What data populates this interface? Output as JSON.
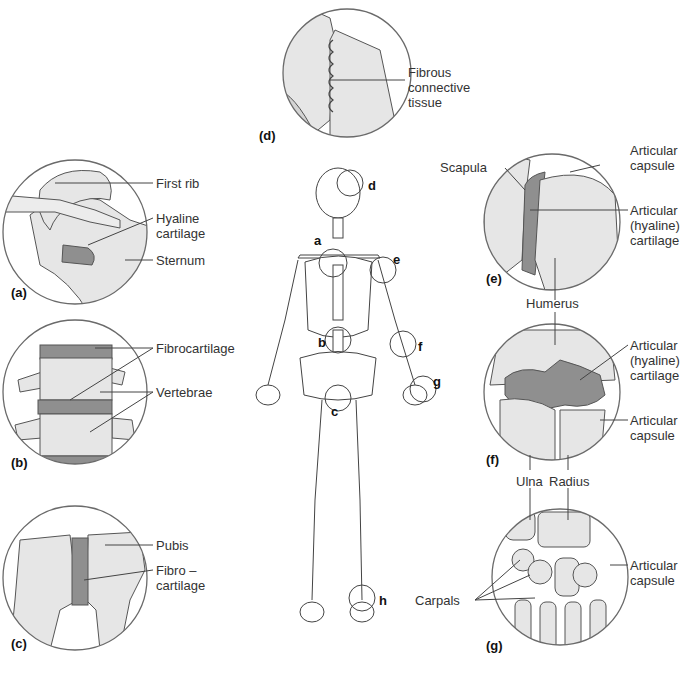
{
  "figure": {
    "type": "anatomy-diagram",
    "colors": {
      "bone": "#e6e6e6",
      "cartilage": "#8f8f8f",
      "outline": "#555555",
      "circle": "#6a6a6a",
      "background": "#ffffff"
    }
  },
  "skeleton_markers": [
    "a",
    "b",
    "c",
    "d",
    "e",
    "f",
    "g",
    "h"
  ],
  "panels": {
    "a": {
      "tag": "(a)",
      "labels": [
        "First rib",
        "Hyaline",
        "cartilage",
        "Sternum"
      ]
    },
    "b": {
      "tag": "(b)",
      "labels": [
        "Fibrocartilage",
        "Vertebrae"
      ]
    },
    "c": {
      "tag": "(c)",
      "labels": [
        "Pubis",
        "Fibro –",
        "cartilage"
      ]
    },
    "d": {
      "tag": "(d)",
      "labels": [
        "Fibrous",
        "connective",
        "tissue"
      ]
    },
    "e": {
      "tag": "(e)",
      "labels": [
        "Scapula",
        "Articular",
        "capsule",
        "Articular",
        "(hyaline)",
        "cartilage",
        "Humerus"
      ]
    },
    "f": {
      "tag": "(f)",
      "labels": [
        "Articular",
        "(hyaline)",
        "cartilage",
        "Articular",
        "capsule",
        "Ulna",
        "Radius"
      ]
    },
    "g": {
      "tag": "(g)",
      "labels": [
        "Carpals",
        "Articular",
        "capsule"
      ]
    }
  }
}
